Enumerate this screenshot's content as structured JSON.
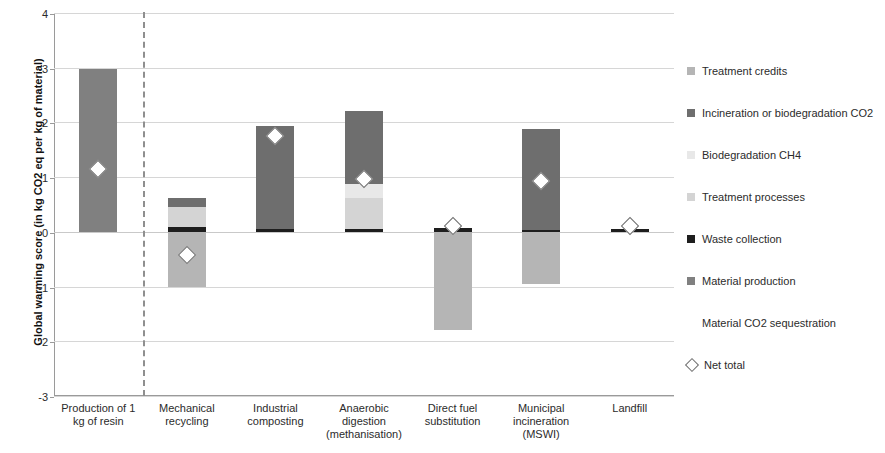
{
  "chart_data": {
    "type": "bar",
    "subtype": "stacked-waterfall",
    "title": "",
    "xlabel": "",
    "ylabel": "Global warming score (in kg CO2 eq per kg of material)",
    "ylim": [
      -3,
      4
    ],
    "yticks": [
      4,
      3,
      2,
      1,
      0,
      -1,
      -2,
      -3
    ],
    "ytick_labels": [
      "4",
      "3",
      "2",
      "1",
      "0",
      "-1",
      "-2",
      "-3"
    ],
    "grid": true,
    "grid_axis": "y",
    "legend_position": "right",
    "categories": [
      "Production of 1 kg of resin",
      "Mechanical recycling",
      "Industrial composting",
      "Anaerobic digestion (methanisation)",
      "Direct fuel substitution",
      "Municipal incineration (MSWI)",
      "Landfill"
    ],
    "category_label_lines": [
      [
        "Production of 1",
        "kg of resin"
      ],
      [
        "Mechanical",
        "recycling"
      ],
      [
        "Industrial",
        "composting"
      ],
      [
        "Anaerobic",
        "digestion",
        "(methanisation)"
      ],
      [
        "Direct fuel",
        "substitution"
      ],
      [
        "Municipal",
        "incineration",
        "(MSWI)"
      ],
      [
        "Landfill"
      ]
    ],
    "series": [
      {
        "name": "Treatment credits",
        "color": "#b5b5b5",
        "values": [
          0,
          -1.0,
          0,
          0,
          -1.8,
          -0.95,
          0
        ]
      },
      {
        "name": "Incineration or biodegradation CO2",
        "color": "#6e6e6e",
        "values": [
          0,
          0.17,
          1.88,
          1.32,
          0,
          1.85,
          0
        ]
      },
      {
        "name": "Biodegradation CH4",
        "color": "#e8e8e8",
        "values": [
          0,
          0,
          0,
          0.26,
          0,
          0,
          0
        ]
      },
      {
        "name": "Treatment processes",
        "color": "#d4d4d4",
        "values": [
          0,
          0.37,
          0,
          0.56,
          0,
          0,
          0
        ]
      },
      {
        "name": "Waste collection",
        "color": "#1e1e1e",
        "values": [
          0,
          0.08,
          0.05,
          0.06,
          0.07,
          0.03,
          0.05
        ]
      },
      {
        "name": "Material production",
        "color": "#808080",
        "values": [
          2.97,
          0,
          0,
          0,
          0,
          0,
          0
        ]
      },
      {
        "name": "Material CO2 sequestration",
        "color": "transparent",
        "values": [
          0,
          0,
          0,
          0,
          0,
          0,
          0
        ]
      }
    ],
    "net_total": {
      "name": "Net total",
      "marker": "diamond",
      "values": [
        1.15,
        -0.42,
        1.75,
        0.97,
        0.1,
        0.93,
        0.1
      ]
    },
    "separator_after_category_index": 0
  },
  "legend": {
    "items": [
      {
        "label": "Treatment credits",
        "swatch": "#b5b5b5",
        "type": "square"
      },
      {
        "label": "Incineration or biodegradation CO2",
        "swatch": "#6e6e6e",
        "type": "square"
      },
      {
        "label": "Biodegradation CH4",
        "swatch": "#e8e8e8",
        "type": "square"
      },
      {
        "label": "Treatment processes",
        "swatch": "#d4d4d4",
        "type": "square"
      },
      {
        "label": "Waste collection",
        "swatch": "#1e1e1e",
        "type": "square"
      },
      {
        "label": "Material production",
        "swatch": "#808080",
        "type": "square"
      },
      {
        "label": "Material CO2 sequestration",
        "swatch": "transparent",
        "type": "blank"
      },
      {
        "label": "Net total",
        "swatch": "#ffffff",
        "type": "diamond"
      }
    ]
  },
  "axis": {
    "y_title": "Global warming score (in kg CO2 eq per kg of material)"
  }
}
